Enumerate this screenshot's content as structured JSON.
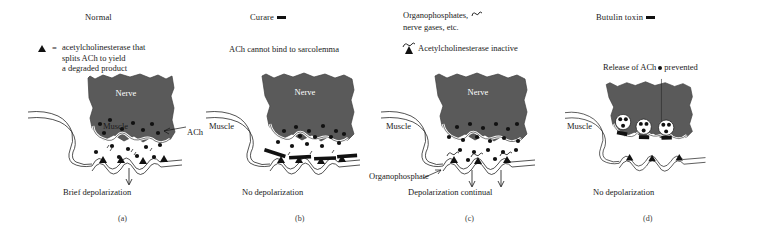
{
  "figure": {
    "background_color": "#ffffff",
    "nerve_color": "#5a5a5a",
    "ink_color": "#1a1a1a",
    "nerve_label": "Nerve",
    "muscle_label": "Muscle"
  },
  "panels": [
    {
      "id": "a",
      "title": "Normal",
      "legend_symbol": "triangle-icon",
      "legend_equals": "=",
      "legend_lines": [
        "acetylcholinesterase that",
        "splits ACh to yield",
        "a degraded product"
      ],
      "nerve_label": "Nerve",
      "muscle_label": "Muscle",
      "ach_label": "ACh",
      "caption": "Brief depolarization",
      "panel_label": "(a)"
    },
    {
      "id": "b",
      "title": "Curare",
      "title_symbol": "bar-icon",
      "subtitle": "ACh cannot bind to sarcolemma",
      "nerve_label": "Nerve",
      "muscle_label": "Muscle",
      "caption": "No depolarization",
      "panel_label": "(b)"
    },
    {
      "id": "c",
      "title_line1": "Organophosphates,",
      "title_symbol": "squiggle-icon",
      "title_line2": "nerve gases, etc.",
      "legend_symbol": "ache-inactive-icon",
      "legend_text": "Acetylcholinesterase inactive",
      "nerve_label": "Nerve",
      "muscle_label": "Muscle",
      "organophosphate_label": "Organophosphate",
      "caption": "Depolarization continual",
      "panel_label": "(c)"
    },
    {
      "id": "d",
      "title": "Butulin toxin",
      "title_symbol": "bar-icon",
      "release_text_before": "Release of ACh",
      "release_symbol": "dot-icon",
      "release_text_after": "prevented",
      "nerve_label": "Nerve",
      "muscle_label": "Muscle",
      "caption": "No depolarization",
      "panel_label": "(d)"
    }
  ]
}
